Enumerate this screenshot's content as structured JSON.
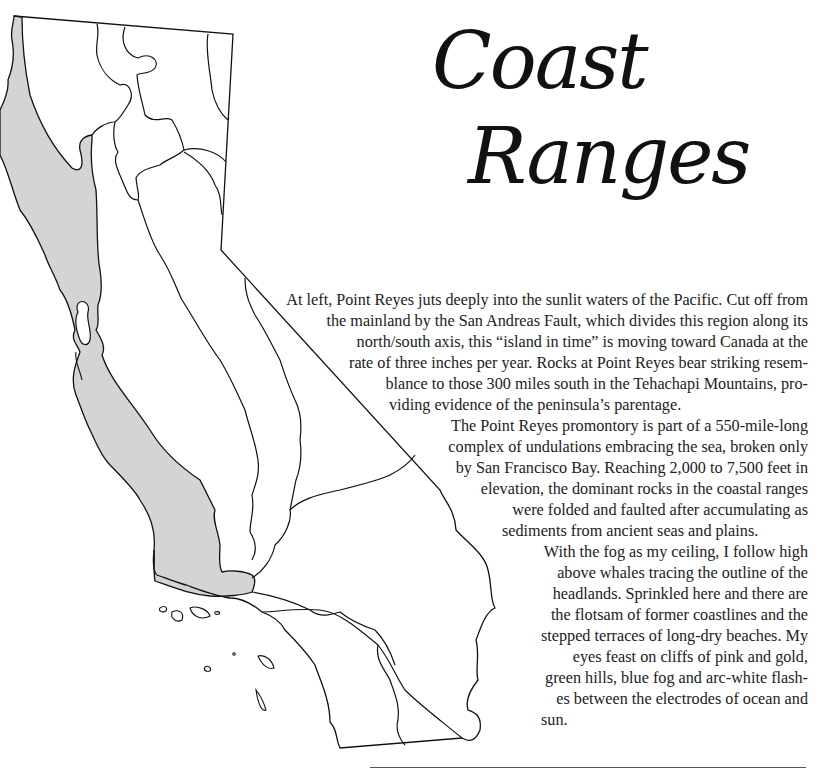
{
  "title": {
    "line1": "Coast",
    "line2": "Ranges"
  },
  "map": {
    "subject": "California outline map with Coast Ranges region shaded",
    "shade_color": "#d4d4d4",
    "line_color": "#111111"
  },
  "paragraphs": [
    {
      "lines": [
        "At left, Point Reyes juts deeply into the sunlit waters of the Pacific. Cut off from",
        "the mainland by the San Andreas Fault, which divides this region along its",
        "north/south axis, this “island in time” is moving toward Canada at the",
        "rate of three inches per year. Rocks at Point Reyes bear striking resem-",
        "blance to those 300 miles south in the Tehachapi Mountains, pro-",
        "viding evidence of the peninsula’s parentage."
      ]
    },
    {
      "lines": [
        "The Point Reyes promontory is part of a 550-mile-long",
        "complex of undulations embracing the sea, broken only",
        "by San Francisco Bay. Reaching 2,000 to 7,500 feet in",
        "elevation, the dominant rocks in the coastal ranges",
        "were folded and faulted after accumulating as",
        "sediments from ancient seas and plains."
      ]
    },
    {
      "lines": [
        "With the fog as my ceiling, I follow high",
        "above whales tracing the outline of the",
        "headlands. Sprinkled here and there are",
        "the flotsam of former coastlines and the",
        "stepped terraces of long-dry beaches. My",
        "eyes feast on cliffs of pink and gold,",
        "green hills, blue fog and arc-white flash-",
        "es between the electrodes of ocean and",
        "sun."
      ]
    }
  ]
}
